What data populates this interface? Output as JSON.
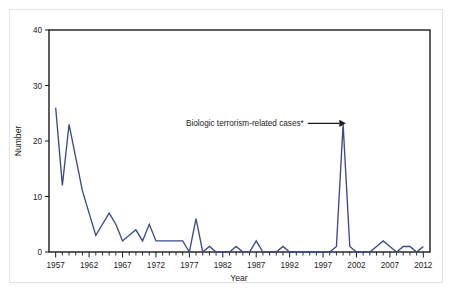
{
  "figure": {
    "background_color": "#ffffff",
    "frame_color": "#1b1b1b",
    "page_border_color": "#e3e3e3"
  },
  "annotation": {
    "label": "Biologic terrorism-related cases*",
    "arrow_icon": "right-arrow-icon",
    "points_to_year": 2001,
    "points_to_value": 23
  },
  "chart_data": {
    "type": "line",
    "title": "",
    "subtitle": "",
    "xlabel": "Year",
    "ylabel": "Number",
    "xlim": [
      1956,
      2013
    ],
    "ylim": [
      0,
      40
    ],
    "grid": false,
    "legend": null,
    "line_color": "#3b4a8c",
    "y_ticks": [
      0,
      10,
      20,
      30,
      40
    ],
    "y_tick_labels": [
      "0",
      "10",
      "20",
      "30",
      "40"
    ],
    "x_ticks": [
      1957,
      1962,
      1967,
      1972,
      1977,
      1982,
      1987,
      1992,
      1997,
      2002,
      2007,
      2012
    ],
    "x_tick_labels": [
      "1957",
      "1962",
      "1967",
      "1972",
      "1977",
      "1982",
      "1987",
      "1992",
      "1997",
      "2002",
      "2007",
      "2012"
    ],
    "x_minor_tick_interval": 1,
    "x": [
      1957,
      1958,
      1959,
      1960,
      1961,
      1962,
      1963,
      1964,
      1965,
      1966,
      1967,
      1968,
      1969,
      1970,
      1971,
      1972,
      1973,
      1974,
      1975,
      1976,
      1977,
      1978,
      1979,
      1980,
      1981,
      1982,
      1983,
      1984,
      1985,
      1986,
      1987,
      1988,
      1989,
      1990,
      1991,
      1992,
      1993,
      1994,
      1995,
      1996,
      1997,
      1998,
      1999,
      2000,
      2001,
      2002,
      2003,
      2004,
      2005,
      2006,
      2007,
      2008,
      2009,
      2010,
      2011,
      2012
    ],
    "values": [
      26,
      12,
      23,
      17,
      11,
      7,
      3,
      5,
      7,
      5,
      2,
      3,
      4,
      2,
      5,
      2,
      2,
      2,
      2,
      2,
      0,
      6,
      0,
      1,
      0,
      0,
      0,
      1,
      0,
      0,
      2,
      0,
      0,
      0,
      1,
      0,
      0,
      0,
      0,
      0,
      0,
      0,
      1,
      23,
      1,
      0,
      0,
      0,
      1,
      2,
      1,
      0,
      1,
      1,
      0,
      1
    ],
    "series": [
      {
        "name": "Number of cases",
        "color": "#3b4a8c",
        "values": [
          26,
          12,
          23,
          17,
          11,
          7,
          3,
          5,
          7,
          5,
          2,
          3,
          4,
          2,
          5,
          2,
          2,
          2,
          2,
          2,
          0,
          6,
          0,
          1,
          0,
          0,
          0,
          1,
          0,
          0,
          2,
          0,
          0,
          0,
          1,
          0,
          0,
          0,
          0,
          0,
          0,
          0,
          1,
          23,
          1,
          0,
          0,
          0,
          1,
          2,
          1,
          0,
          1,
          1,
          0,
          1
        ]
      }
    ]
  }
}
